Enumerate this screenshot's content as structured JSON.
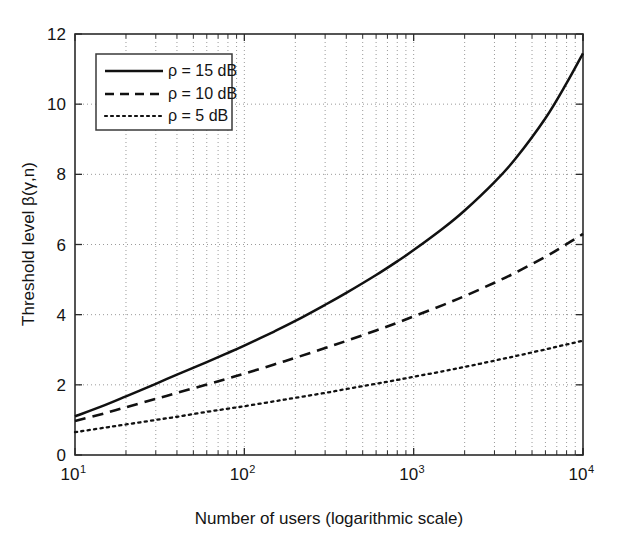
{
  "chart_data": {
    "type": "line",
    "title": "",
    "xlabel": "Number of users (logarithmic scale)",
    "ylabel": "Threshold level β(γ,n)",
    "xscale": "log",
    "yscale": "linear",
    "xlim": [
      10,
      10000
    ],
    "ylim": [
      0,
      12
    ],
    "grid": true,
    "legend_position": "upper-left-inside",
    "xticks": [
      {
        "value": 10,
        "label": "10",
        "exponent": "1"
      },
      {
        "value": 100,
        "label": "10",
        "exponent": "2"
      },
      {
        "value": 1000,
        "label": "10",
        "exponent": "3"
      },
      {
        "value": 10000,
        "label": "10",
        "exponent": "4"
      }
    ],
    "yticks": [
      {
        "value": 0,
        "label": "0"
      },
      {
        "value": 2,
        "label": "2"
      },
      {
        "value": 4,
        "label": "4"
      },
      {
        "value": 6,
        "label": "6"
      },
      {
        "value": 8,
        "label": "8"
      },
      {
        "value": 10,
        "label": "10"
      },
      {
        "value": 12,
        "label": "12"
      }
    ],
    "x": [
      10,
      15,
      20,
      30,
      40,
      60,
      80,
      100,
      150,
      200,
      300,
      400,
      600,
      800,
      1000,
      1500,
      2000,
      3000,
      4000,
      6000,
      8000,
      10000
    ],
    "series": [
      {
        "name": "ρ = 15 dB",
        "style": "solid",
        "color": "#111111",
        "values": [
          1.1,
          1.42,
          1.67,
          2.03,
          2.29,
          2.65,
          2.91,
          3.12,
          3.52,
          3.82,
          4.28,
          4.62,
          5.13,
          5.52,
          5.84,
          6.47,
          6.97,
          7.78,
          8.45,
          9.6,
          10.6,
          11.45
        ]
      },
      {
        "name": "ρ = 10 dB",
        "style": "dashed",
        "color": "#111111",
        "values": [
          0.97,
          1.19,
          1.36,
          1.6,
          1.77,
          2.01,
          2.18,
          2.32,
          2.58,
          2.77,
          3.05,
          3.25,
          3.55,
          3.77,
          3.95,
          4.28,
          4.53,
          4.91,
          5.2,
          5.65,
          6.01,
          6.3
        ]
      },
      {
        "name": "ρ = 5 dB",
        "style": "dotted",
        "color": "#111111",
        "values": [
          0.65,
          0.78,
          0.87,
          1.0,
          1.09,
          1.23,
          1.32,
          1.39,
          1.53,
          1.63,
          1.77,
          1.88,
          2.03,
          2.14,
          2.23,
          2.39,
          2.51,
          2.69,
          2.82,
          3.01,
          3.15,
          3.26
        ]
      }
    ],
    "annotations": []
  },
  "legend": {
    "items": [
      {
        "label": "ρ = 15 dB",
        "style": "solid"
      },
      {
        "label": "ρ = 10 dB",
        "style": "dashed"
      },
      {
        "label": "ρ = 5 dB",
        "style": "dotted"
      }
    ]
  },
  "axes": {
    "x_title": "Number of users (logarithmic scale)",
    "y_title": "Threshold level β(γ,n)"
  }
}
